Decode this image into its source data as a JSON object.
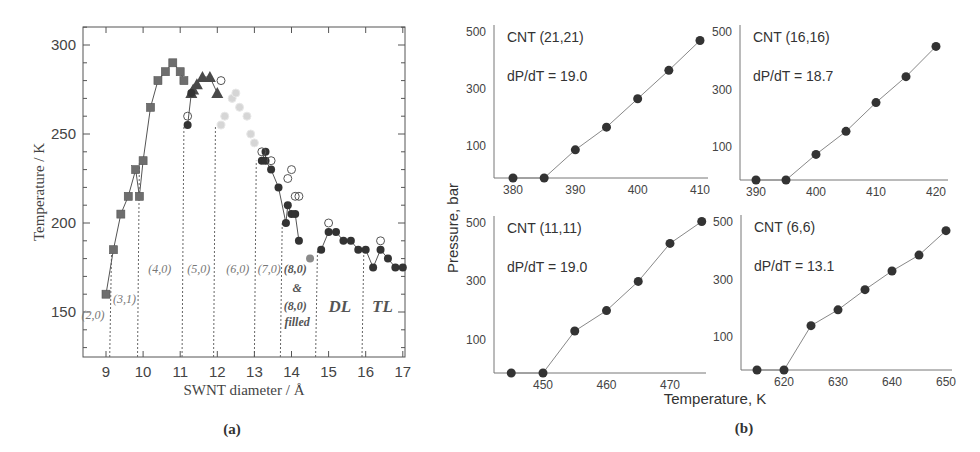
{
  "figure": {
    "panel_a_label": "(a)",
    "panel_b_label": "(b)"
  },
  "chart_data": [
    {
      "type": "scatter",
      "panel": "(a)",
      "title": "",
      "xlabel": "SWNT diameter / Å",
      "ylabel": "Temperature / K",
      "xlim": [
        8.4,
        17.05
      ],
      "ylim": [
        125,
        310
      ],
      "xticks": [
        9,
        10,
        11,
        12,
        13,
        14,
        15,
        16,
        17
      ],
      "yticks": [
        150,
        200,
        250,
        300
      ],
      "grid": false,
      "series": [
        {
          "name": "squares",
          "marker": "square",
          "color": "#6e6e6e",
          "line": true,
          "points": [
            [
              9.0,
              160
            ],
            [
              9.2,
              185
            ],
            [
              9.4,
              205
            ],
            [
              9.6,
              215
            ],
            [
              9.8,
              230
            ],
            [
              9.9,
              215
            ],
            [
              10.0,
              235
            ],
            [
              10.2,
              265
            ],
            [
              10.4,
              280
            ],
            [
              10.6,
              285
            ],
            [
              10.8,
              290
            ],
            [
              11.0,
              285
            ],
            [
              11.1,
              280
            ]
          ]
        },
        {
          "name": "triangles",
          "marker": "triangle",
          "color": "#4a4a4a",
          "line": true,
          "points": [
            [
              11.3,
              273
            ],
            [
              11.35,
              275
            ],
            [
              11.45,
              278
            ],
            [
              11.6,
              282
            ],
            [
              11.8,
              282
            ],
            [
              12.0,
              273
            ]
          ]
        },
        {
          "name": "light-circles",
          "marker": "circle-light",
          "color": "#d6d6d6",
          "line": false,
          "points": [
            [
              12.1,
              255
            ],
            [
              12.2,
              260
            ],
            [
              12.4,
              270
            ],
            [
              12.5,
              273
            ],
            [
              12.6,
              265
            ],
            [
              12.8,
              260
            ],
            [
              12.9,
              250
            ],
            [
              13.0,
              245
            ]
          ]
        },
        {
          "name": "filled-circles",
          "marker": "circle",
          "color": "#333333",
          "line": true,
          "points": [
            [
              11.2,
              255
            ],
            [
              11.3,
              273
            ]
          ]
        },
        {
          "name": "filled-circles-2",
          "marker": "circle",
          "color": "#333333",
          "line": true,
          "points": [
            [
              13.2,
              235
            ],
            [
              13.3,
              240
            ],
            [
              13.3,
              235
            ],
            [
              13.45,
              230
            ],
            [
              13.65,
              220
            ],
            [
              13.85,
              200
            ],
            [
              13.9,
              210
            ],
            [
              14.0,
              205
            ],
            [
              14.1,
              205
            ],
            [
              14.2,
              190
            ]
          ]
        },
        {
          "name": "gray-circle",
          "marker": "circle",
          "color": "#8a8a8a",
          "line": false,
          "points": [
            [
              14.5,
              180
            ]
          ]
        },
        {
          "name": "filled-circles-3",
          "marker": "circle",
          "color": "#333333",
          "line": true,
          "points": [
            [
              14.8,
              185
            ],
            [
              15.0,
              195
            ],
            [
              15.2,
              195
            ],
            [
              15.4,
              190
            ],
            [
              15.6,
              190
            ],
            [
              15.8,
              185
            ],
            [
              16.0,
              185
            ],
            [
              16.2,
              175
            ],
            [
              16.4,
              185
            ],
            [
              16.6,
              180
            ],
            [
              16.8,
              175
            ],
            [
              17.0,
              175
            ]
          ]
        },
        {
          "name": "open-circles",
          "marker": "circle-open",
          "color": "#555555",
          "line": false,
          "points": [
            [
              11.2,
              260
            ],
            [
              12.1,
              280
            ],
            [
              13.2,
              240
            ],
            [
              13.45,
              235
            ],
            [
              13.9,
              225
            ],
            [
              14.0,
              230
            ],
            [
              14.1,
              215
            ],
            [
              14.2,
              215
            ],
            [
              15.0,
              200
            ],
            [
              16.4,
              190
            ]
          ]
        }
      ],
      "dividers": [
        9.1,
        9.85,
        11.05,
        11.9,
        13.0,
        13.7,
        14.65,
        15.9
      ],
      "annotations": [
        {
          "text": "(2,0)",
          "x": 8.65,
          "y": 146,
          "italic": true
        },
        {
          "text": "(3,1)",
          "x": 9.5,
          "y": 155,
          "italic": true
        },
        {
          "text": "(4,0)",
          "x": 10.45,
          "y": 172,
          "italic": true
        },
        {
          "text": "(5,0)",
          "x": 11.5,
          "y": 172,
          "italic": true
        },
        {
          "text": "(6,0)",
          "x": 12.55,
          "y": 172,
          "italic": true
        },
        {
          "text": "(7,0)",
          "x": 13.4,
          "y": 172,
          "italic": true
        },
        {
          "text": "(8,0)",
          "x": 14.1,
          "y": 172,
          "italic": true,
          "bold": true
        },
        {
          "text": "&",
          "x": 14.15,
          "y": 161,
          "italic": true,
          "bold": true
        },
        {
          "text": "(8,0)",
          "x": 14.1,
          "y": 151,
          "italic": true,
          "bold": true
        },
        {
          "text": "filled",
          "x": 14.15,
          "y": 142,
          "italic": true,
          "bold": true
        },
        {
          "text": "DL",
          "x": 15.3,
          "y": 150,
          "italic": true,
          "bold": true,
          "large": true
        },
        {
          "text": "TL",
          "x": 16.45,
          "y": 150,
          "italic": true,
          "bold": true,
          "large": true
        }
      ]
    },
    {
      "type": "line",
      "panel": "(b)",
      "shared_xlabel": "Temperature, K",
      "shared_ylabel": "Pressure, bar",
      "subplots": [
        {
          "title": "CNT (21,21)",
          "slope_label": "dP/dT = 19.0",
          "x": [
            380,
            385,
            390,
            395,
            400,
            405,
            410
          ],
          "y": [
            0,
            0,
            85,
            165,
            265,
            365,
            470
          ],
          "xticks": [
            380,
            390,
            400,
            410
          ],
          "yticks": [
            100,
            300,
            500
          ],
          "xlim": [
            377,
            411
          ],
          "ylim": [
            0,
            520
          ]
        },
        {
          "title": "CNT (16,16)",
          "slope_label": "dP/dT = 18.7",
          "x": [
            390,
            395,
            400,
            405,
            410,
            415,
            420
          ],
          "y": [
            0,
            0,
            75,
            155,
            255,
            345,
            450
          ],
          "xticks": [
            390,
            400,
            410,
            420
          ],
          "yticks": [
            100,
            300,
            500
          ],
          "xlim": [
            387,
            421
          ],
          "ylim": [
            0,
            520
          ]
        },
        {
          "title": "CNT (11,11)",
          "slope_label": "dP/dT = 19.0",
          "x": [
            445,
            450,
            455,
            460,
            465,
            470,
            475
          ],
          "y": [
            0,
            0,
            130,
            200,
            300,
            430,
            505
          ],
          "xticks": [
            450,
            460,
            470
          ],
          "yticks": [
            100,
            300,
            500
          ],
          "xlim": [
            442,
            476
          ],
          "ylim": [
            0,
            520
          ]
        },
        {
          "title": "CNT (6,6)",
          "slope_label": "dP/dT = 13.1",
          "x": [
            615,
            620,
            625,
            630,
            635,
            640,
            645,
            650
          ],
          "y": [
            0,
            0,
            140,
            195,
            265,
            330,
            385,
            470
          ],
          "xticks": [
            620,
            630,
            640,
            650
          ],
          "yticks": [
            100,
            300,
            500
          ],
          "xlim": [
            612,
            650.5
          ],
          "ylim": [
            0,
            520
          ]
        }
      ]
    }
  ]
}
